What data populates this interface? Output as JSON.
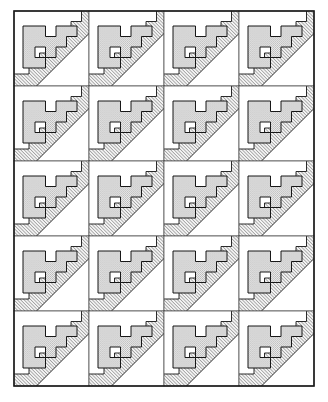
{
  "figure": {
    "type": "geometric-tiling",
    "background_color": "#ffffff",
    "outline_color": "#1a1a1a",
    "stipple_fill_color": "#cfcfcf",
    "hatch_fill_color": "#e8e8e8",
    "hatch_line_color": "#2b2b2b",
    "white_fill_color": "#ffffff",
    "grid": {
      "columns": 4,
      "rows": 5,
      "tile_width": 75,
      "tile_height": 75,
      "origin_x": 14,
      "origin_y": 11,
      "border_stroke_width": 1.6,
      "cell_stroke_width": 0.9
    },
    "tile": {
      "name": "stepped-f-with-diagonal-band",
      "size": 100,
      "description": "Stippled stepped F-shaped polygon in upper left with a diagonal hatched band sweeping from lower-left to upper-right",
      "f_shape_points": "18,20 46,20 46,34 60,34 60,20 74,20 74,48 60,48 60,62 46,62 46,48 32,48 32,62 46,62 46,76 18,76 18,62 18,20",
      "stepped_polygon_points": "16,18 48,18 48,34 62,34 62,18 78,18 78,50 62,50 62,66 46,66 46,50 32,50 32,66 16,66 16,18",
      "band_hatch_angle": 45,
      "band_hatch_spacing": 3.2,
      "band_hatch_width": 0.85,
      "stipple_dot_spacing": 2.6,
      "stipple_dot_radius": 0.62
    }
  }
}
